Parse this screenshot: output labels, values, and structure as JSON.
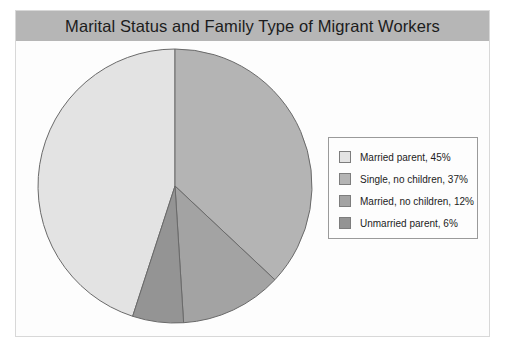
{
  "chart_data": {
    "type": "pie",
    "title": "Marital Status and Family Type of Migrant Workers",
    "xlabel": "",
    "ylabel": "",
    "legend_position": "right",
    "grid": false,
    "start_angle_deg": 0,
    "direction": "clockwise",
    "categories": [
      "Married parent",
      "Single, no children",
      "Married, no children",
      "Unmarried parent"
    ],
    "values": [
      45,
      37,
      12,
      6
    ],
    "unit": "%",
    "slices": [
      {
        "label": "Married parent",
        "value": 45,
        "legend_text": "Married parent, 45%",
        "color": "#e3e3e3",
        "start_deg": 198,
        "end_deg": 360
      },
      {
        "label": "Single, no children",
        "value": 37,
        "legend_text": "Single, no children, 37%",
        "color": "#b4b4b4",
        "start_deg": 0,
        "end_deg": 133.2
      },
      {
        "label": "Married, no children",
        "value": 12,
        "legend_text": "Married, no children, 12%",
        "color": "#a3a3a3",
        "start_deg": 133.2,
        "end_deg": 176.4
      },
      {
        "label": "Unmarried parent",
        "value": 6,
        "legend_text": "Unmarried parent, 6%",
        "color": "#949494",
        "start_deg": 176.4,
        "end_deg": 198
      }
    ]
  },
  "title": {
    "text": "Marital Status and Family Type of Migrant Workers",
    "bar_color": "#b6b6b6"
  },
  "legend": {
    "items": [
      {
        "label": "Married parent, 45%",
        "color": "#e3e3e3"
      },
      {
        "label": "Single, no children, 37%",
        "color": "#b4b4b4"
      },
      {
        "label": "Married, no children, 12%",
        "color": "#a3a3a3"
      },
      {
        "label": "Unmarried parent, 6%",
        "color": "#949494"
      }
    ]
  },
  "pie_geometry": {
    "cx": 145,
    "cy": 145,
    "r": 137,
    "stroke": "#6a6a6a"
  }
}
